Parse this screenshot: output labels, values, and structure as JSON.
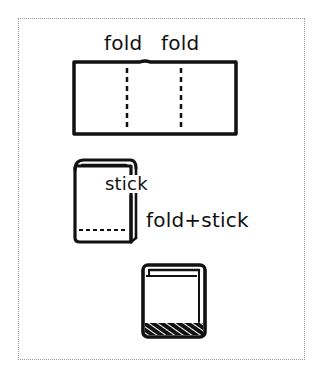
{
  "diagram": {
    "type": "instruction-diagram",
    "steps": [
      {
        "step": 1,
        "name": "flat-sheet",
        "labels": [
          "fold",
          "fold"
        ],
        "fold_lines": 2
      },
      {
        "step": 2,
        "name": "folded-booklet",
        "labels": [
          "stick",
          "fold+stick"
        ]
      },
      {
        "step": 3,
        "name": "finished-book",
        "labels": []
      }
    ]
  },
  "labels": {
    "fold_left": "fold",
    "fold_right": "fold",
    "stick": "stick",
    "fold_stick": "fold+stick"
  },
  "colors": {
    "ink": "#111111",
    "frame": "#9a9a9a",
    "background": "#ffffff"
  }
}
